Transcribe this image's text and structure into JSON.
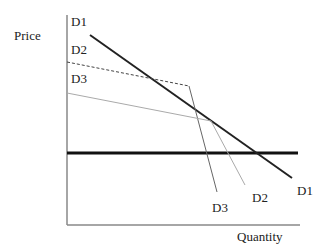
{
  "diagram": {
    "axes": {
      "y_label": "Price",
      "x_label": "Quantity"
    },
    "curves": {
      "d1": {
        "label_top": "D1",
        "label_bottom": "D1"
      },
      "d2": {
        "label_top": "D2",
        "label_bottom": "D2"
      },
      "d3": {
        "label_top": "D3",
        "label_bottom": "D3"
      }
    },
    "colors": {
      "axis": "#888888",
      "d1": "#222222",
      "d2": "#444444",
      "d3": "#999999",
      "price_line": "#111111"
    }
  }
}
